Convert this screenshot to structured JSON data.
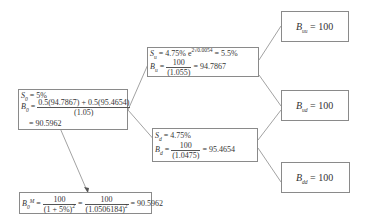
{
  "root": {
    "s_label": "S",
    "s_sub": "0",
    "s_value": " = 5%",
    "b_label": "B",
    "b_sub": "0",
    "b_eq": " = ",
    "b_num": "0.5(94.7867) + 0.5(95.4654)",
    "b_den": "(1.05)",
    "b_result": "= 90.5962"
  },
  "up": {
    "s_label": "S",
    "s_sub": "u",
    "s_value": " = 4.75% e",
    "s_exp": "2√0.0054",
    "s_result": " = 5.5%",
    "b_label": "B",
    "b_sub": "u",
    "b_eq": " = ",
    "b_num": "100",
    "b_den": "(1.055)",
    "b_result": " = 94.7867"
  },
  "down": {
    "s_label": "S",
    "s_sub": "d",
    "s_value": " = 4.75%",
    "b_label": "B",
    "b_sub": "d",
    "b_eq": " = ",
    "b_num": "100",
    "b_den": "(1.0475)",
    "b_result": " = 95.4654"
  },
  "leaves": [
    {
      "label": "B",
      "sub": "uu",
      "value": " = 100"
    },
    {
      "label": "B",
      "sub": "ud",
      "value": " = 100"
    },
    {
      "label": "B",
      "sub": "dd",
      "value": " = 100"
    }
  ],
  "market": {
    "label": "B",
    "sub": "0",
    "sup": "M",
    "eq": " = ",
    "num1": "100",
    "den1": "(1 + 5%)",
    "den1_sup": "2",
    "eq2": " = ",
    "num2": "100",
    "den2": "(1.0506184)",
    "den2_sup": "2",
    "result": " = 90.5962"
  },
  "colors": {
    "line": "#8a8a8a",
    "text": "#333333",
    "background": "#ffffff"
  }
}
